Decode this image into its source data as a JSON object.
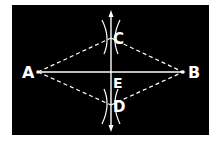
{
  "diagram": {
    "background": "#000000",
    "stroke": "#ffffff",
    "labels": {
      "A": "A",
      "B": "B",
      "C": "C",
      "D": "D",
      "E": "E"
    },
    "points": {
      "A": [
        38,
        72
      ],
      "B": [
        183,
        72
      ],
      "C": [
        111,
        38
      ],
      "D": [
        111,
        105
      ],
      "E": [
        111,
        72
      ]
    }
  }
}
